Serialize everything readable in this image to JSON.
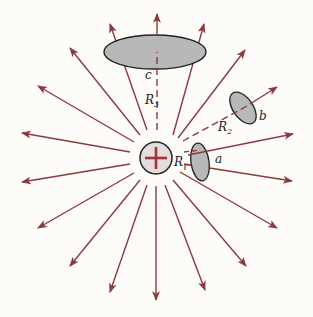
{
  "figure": {
    "charge": {
      "symbol": "+",
      "center": [
        156,
        158
      ],
      "radius": 16
    },
    "colors": {
      "field_line": "#8b3a3e",
      "surface_fill": "#b8b8b8",
      "surface_stroke": "#222222",
      "charge_fill": "#e4dcdc",
      "background": "#fdfcf8"
    },
    "surfaces": [
      {
        "id": "a",
        "label": "a",
        "distance_label": "R"
      },
      {
        "id": "b",
        "label": "b",
        "distance_label": "R",
        "distance_sub": "2"
      },
      {
        "id": "c",
        "label": "c",
        "distance_label": "R",
        "distance_sub": "3"
      }
    ],
    "field_line_count": 18
  }
}
